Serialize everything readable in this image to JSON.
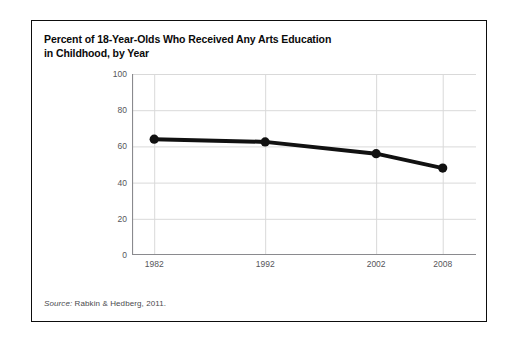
{
  "figure": {
    "title": "Percent of 18-Year-Olds Who Received Any Arts Education\nin Childhood, by Year",
    "source_label": "Source:",
    "source_text": " Rabkin & Hedberg, 2011.",
    "colors": {
      "frame_border": "#0d0d0d",
      "series_line": "#111111",
      "marker": "#111111",
      "gridline": "#d9d9d9",
      "axis_line": "#8a8a8e",
      "tick_text": "#56565a",
      "title_text": "#0a0a0a",
      "background": "#ffffff"
    }
  },
  "chart_data": {
    "type": "line",
    "title": "Percent of 18-Year-Olds Who Received Any Arts Education in Childhood, by Year",
    "xlabel": "",
    "ylabel": "",
    "x": [
      1982,
      1992,
      2002,
      2008
    ],
    "categories": [
      "1982",
      "1992",
      "2002",
      "2008"
    ],
    "values": [
      64,
      62.5,
      56,
      48
    ],
    "series": [
      {
        "name": "Percent receiving any arts education in childhood",
        "values": [
          64,
          62.5,
          56,
          48
        ]
      }
    ],
    "xlim": [
      1980,
      2011
    ],
    "ylim": [
      0,
      100
    ],
    "xticks": [
      1982,
      1992,
      2002,
      2008
    ],
    "xtick_labels": [
      "1982",
      "1992",
      "2002",
      "2008"
    ],
    "yticks": [
      0,
      20,
      40,
      60,
      80,
      100
    ],
    "ytick_labels": [
      "0",
      "20",
      "40",
      "60",
      "80",
      "100"
    ],
    "grid": true,
    "grid_axes": "both",
    "legend": false,
    "legend_position": "none",
    "marker": "circle",
    "annotations": []
  }
}
